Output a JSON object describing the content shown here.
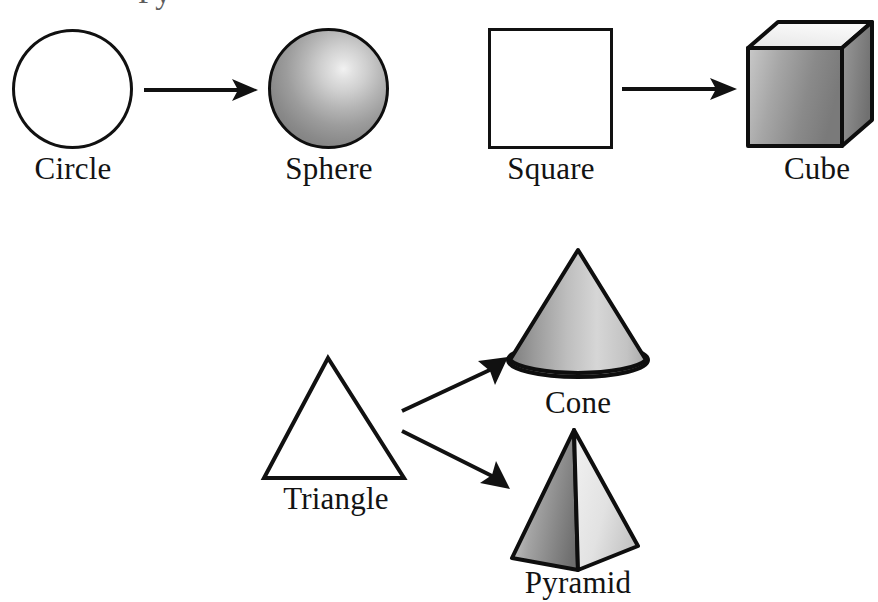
{
  "diagram": {
    "background_color": "#ffffff",
    "line_color": "#111111",
    "fill_color": "#ffffff",
    "shade_light": "#ededed",
    "shade_mid": "#a8a8a8",
    "shade_dark": "#6f6f6f",
    "clipped_top_text": "Py"
  },
  "rows": [
    {
      "id": "row-top-left",
      "source": {
        "name": "circle",
        "label": "Circle",
        "kind": "2d"
      },
      "target": {
        "name": "sphere",
        "label": "Sphere",
        "kind": "3d"
      },
      "connector": "arrow-right"
    },
    {
      "id": "row-top-right",
      "source": {
        "name": "square",
        "label": "Square",
        "kind": "2d"
      },
      "target": {
        "name": "cube",
        "label": "Cube",
        "kind": "3d"
      },
      "connector": "arrow-right"
    },
    {
      "id": "row-bottom",
      "source": {
        "name": "triangle",
        "label": "Triangle",
        "kind": "2d"
      },
      "targets": [
        {
          "name": "cone",
          "label": "Cone",
          "kind": "3d",
          "connector": "arrow-up-right"
        },
        {
          "name": "pyramid",
          "label": "Pyramid",
          "kind": "3d",
          "connector": "arrow-down-right"
        }
      ]
    }
  ],
  "labels": {
    "circle": "Circle",
    "sphere": "Sphere",
    "square": "Square",
    "cube": "Cube",
    "triangle": "Triangle",
    "cone": "Cone",
    "pyramid": "Pyramid"
  }
}
